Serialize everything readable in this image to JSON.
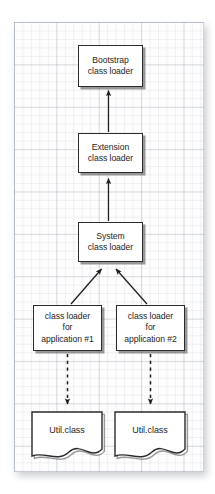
{
  "diagram": {
    "background": {
      "style": "graph-paper",
      "grid_color": "#96a0af",
      "paper_color": "#fdfdfd"
    },
    "colors": {
      "node_border": "#2b2b2b",
      "node_fill": "#ffffff",
      "text": "#1d1d1d",
      "connector": "#1d1d1d",
      "shadow": "#46464b"
    },
    "nodes": [
      {
        "id": "bootstrap",
        "line1": "Bootstrap",
        "line2": "class loader",
        "line3": ""
      },
      {
        "id": "extension",
        "line1": "Extension",
        "line2": "class loader",
        "line3": ""
      },
      {
        "id": "system",
        "line1": "System",
        "line2": "class loader",
        "line3": ""
      },
      {
        "id": "app1",
        "line1": "class loader",
        "line2": "for",
        "line3": "application #1"
      },
      {
        "id": "app2",
        "line1": "class loader",
        "line2": "for",
        "line3": "application #2"
      }
    ],
    "documents": [
      {
        "id": "util1",
        "label": "Util.class"
      },
      {
        "id": "util2",
        "label": "Util.class"
      }
    ],
    "connectors": [
      {
        "from": "extension",
        "to": "bootstrap",
        "style": "solid",
        "arrow": "end"
      },
      {
        "from": "system",
        "to": "extension",
        "style": "solid",
        "arrow": "end"
      },
      {
        "from": "app1",
        "to": "system",
        "style": "solid",
        "arrow": "end"
      },
      {
        "from": "app2",
        "to": "system",
        "style": "solid",
        "arrow": "end"
      },
      {
        "from": "app1",
        "to": "util1",
        "style": "dashed",
        "arrow": "end"
      },
      {
        "from": "app2",
        "to": "util2",
        "style": "dashed",
        "arrow": "end"
      }
    ]
  }
}
